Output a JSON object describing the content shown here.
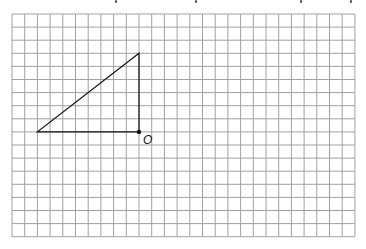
{
  "diagram": {
    "type": "grid-triangle",
    "grid": {
      "columns": 27,
      "rows": 17,
      "origin_px": [
        12,
        14
      ],
      "cell_width_px": 12.7,
      "cell_height_px": 13.1,
      "line_color": "#a0a0a0",
      "border_color": "#a0a0a0"
    },
    "triangle": {
      "vertices_grid": [
        [
          2,
          9
        ],
        [
          10,
          9
        ],
        [
          10,
          3
        ]
      ],
      "stroke_color": "#111111",
      "stroke_width": 1.2
    },
    "point": {
      "name": "O",
      "grid": [
        10,
        9
      ],
      "label": "O",
      "label_offset_px": [
        4,
        2
      ],
      "color": "#111111"
    },
    "clipped_header_descenders_x": [
      115,
      195,
      300,
      350
    ]
  }
}
